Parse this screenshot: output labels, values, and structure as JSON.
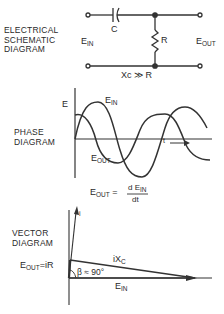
{
  "schematic": {
    "title_lines": [
      "ELECTRICAL",
      "SCHEMATIC",
      "DIAGRAM"
    ],
    "capacitor_label": "C",
    "resistor_label": "R",
    "input_label": "E",
    "input_sub": "IN",
    "output_label": "E",
    "output_sub": "OUT",
    "condition": "Xc ≫ R"
  },
  "phase": {
    "title_lines": [
      "PHASE",
      "DIAGRAM"
    ],
    "axis_label": "E",
    "ein_label": "E",
    "ein_sub": "IN",
    "eout_label": "E",
    "eout_sub": "OUT",
    "time_label": "t",
    "formula_lhs": "E",
    "formula_lhs_sub": "OUT",
    "formula_eq": "=",
    "formula_num": "d E",
    "formula_num_sub": "IN",
    "formula_den": "dt"
  },
  "vector": {
    "title_lines": [
      "VECTOR",
      "DIAGRAM"
    ],
    "current_label": "i",
    "eout_label": "E",
    "eout_sub": "OUT",
    "eout_eq": "=iR",
    "ixc_label": "iX",
    "ixc_sub": "C",
    "angle_label": "β ≈ 90°",
    "ein_label": "E",
    "ein_sub": "IN"
  }
}
